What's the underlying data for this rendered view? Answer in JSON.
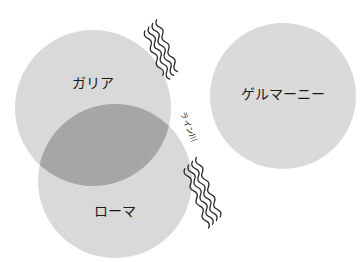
{
  "diagram": {
    "regions": [
      {
        "id": "gallia",
        "label": "ガリア",
        "cx": 93,
        "cy": 108,
        "r": 78,
        "fill": "#d9d9d9",
        "label_x": 93,
        "label_y": 84
      },
      {
        "id": "roma",
        "label": "ローマ",
        "cx": 115,
        "cy": 181,
        "r": 77,
        "fill": "#d9d9d9",
        "label_x": 115,
        "label_y": 212
      },
      {
        "id": "germania",
        "label": "ゲルマーニー",
        "cx": 283,
        "cy": 96,
        "r": 73,
        "fill": "#dadada",
        "label_x": 283,
        "label_y": 95
      }
    ],
    "overlap": {
      "between": [
        "gallia",
        "roma"
      ],
      "fill": "#a6a6a6"
    },
    "river": {
      "label": "ライン川",
      "label_x": 188,
      "label_y": 127,
      "label_rotation": 68,
      "wave_color": "#2a2a2a"
    }
  }
}
